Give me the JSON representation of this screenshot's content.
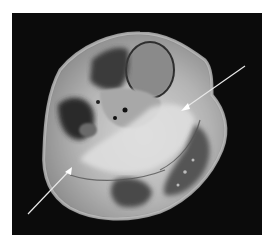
{
  "image": {
    "description": "Axial MRI cross-section of a limb (knee/proximal leg) with two white annotation arrows",
    "colors": {
      "background": "#0b0b0b",
      "page": "#ffffff",
      "arrow": "#e8e8e8",
      "tissue_bright": "#d9d9d9",
      "tissue_mid": "#9a9a9a",
      "tissue_dark": "#3a3a3a"
    },
    "arrows": [
      {
        "name": "upper-right-arrow",
        "from": [
          245,
          66
        ],
        "to": [
          183,
          109
        ]
      },
      {
        "name": "lower-left-arrow",
        "from": [
          28,
          214
        ],
        "to": [
          71,
          169
        ]
      }
    ]
  }
}
